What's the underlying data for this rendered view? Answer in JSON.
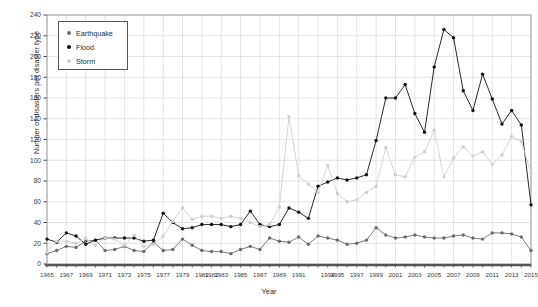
{
  "chart_data": {
    "type": "line",
    "title": "",
    "xlabel": "Year",
    "ylabel": "Number of disasters per disaster type",
    "xlim": [
      1965,
      2015
    ],
    "ylim": [
      0,
      240
    ],
    "ytick_step": 20,
    "yticks": [
      0,
      20,
      40,
      60,
      80,
      100,
      120,
      140,
      160,
      180,
      200,
      220,
      240
    ],
    "xticks": [
      1965,
      1967,
      1969,
      1971,
      1973,
      1975,
      1977,
      1979,
      1981,
      1982,
      1983,
      1985,
      1987,
      1989,
      1991,
      1994,
      1995,
      1997,
      1999,
      2001,
      2003,
      2005,
      2007,
      2009,
      2011,
      2013,
      2015
    ],
    "xtick_labels": [
      "1965",
      "1967",
      "1969",
      "1971",
      "1973",
      "1975",
      "1977",
      "1979",
      "1981",
      "1982",
      "1983",
      "1985",
      "1987",
      "1989",
      "1991",
      "1994",
      "1995",
      "1997",
      "1999",
      "2001",
      "2003",
      "2005",
      "2007",
      "2009",
      "2011",
      "2013",
      "2015"
    ],
    "grid": true,
    "legend_position": "upper-left",
    "x": [
      1965,
      1966,
      1967,
      1968,
      1969,
      1970,
      1971,
      1972,
      1973,
      1974,
      1975,
      1976,
      1977,
      1978,
      1979,
      1980,
      1981,
      1982,
      1983,
      1984,
      1985,
      1986,
      1987,
      1988,
      1989,
      1990,
      1991,
      1992,
      1993,
      1994,
      1995,
      1996,
      1997,
      1998,
      1999,
      2000,
      2001,
      2002,
      2003,
      2004,
      2005,
      2006,
      2007,
      2008,
      2009,
      2010,
      2011,
      2012,
      2013,
      2014,
      2015
    ],
    "series": [
      {
        "name": "Earthquake",
        "color": "#6b6b6b",
        "marker": "circle",
        "values": [
          10,
          13,
          17,
          16,
          22,
          23,
          13,
          14,
          17,
          13,
          12,
          21,
          13,
          14,
          24,
          18,
          13,
          12,
          12,
          10,
          14,
          17,
          14,
          25,
          22,
          21,
          26,
          19,
          27,
          25,
          23,
          19,
          20,
          23,
          35,
          28,
          25,
          26,
          28,
          26,
          25,
          25,
          27,
          28,
          25,
          24,
          30,
          30,
          29,
          26,
          13
        ]
      },
      {
        "name": "Flood",
        "color": "#111111",
        "marker": "circle",
        "values": [
          24,
          21,
          30,
          27,
          19,
          23,
          25,
          25,
          25,
          25,
          22,
          23,
          49,
          40,
          34,
          35,
          38,
          38,
          38,
          36,
          38,
          51,
          38,
          36,
          38,
          54,
          50,
          44,
          75,
          79,
          83,
          81,
          83,
          86,
          119,
          160,
          160,
          173,
          145,
          127,
          190,
          226,
          218,
          167,
          148,
          183,
          159,
          135,
          148,
          134,
          57
        ]
      },
      {
        "name": "Storm",
        "color": "#cfcfcf",
        "marker": "circle",
        "values": [
          11,
          22,
          22,
          20,
          25,
          18,
          25,
          24,
          18,
          28,
          17,
          19,
          27,
          41,
          54,
          43,
          46,
          46,
          44,
          46,
          44,
          40,
          36,
          38,
          55,
          142,
          85,
          77,
          69,
          95,
          68,
          60,
          62,
          69,
          75,
          112,
          86,
          84,
          103,
          108,
          129,
          84,
          102,
          113,
          104,
          108,
          96,
          105,
          123,
          118,
          88
        ]
      }
    ]
  },
  "legend": {
    "items": [
      {
        "label": "Earthquake"
      },
      {
        "label": "Flood"
      },
      {
        "label": "Storm"
      }
    ]
  },
  "axes": {
    "x_title": "Year",
    "y_title": "Number of disasters per disaster type"
  }
}
